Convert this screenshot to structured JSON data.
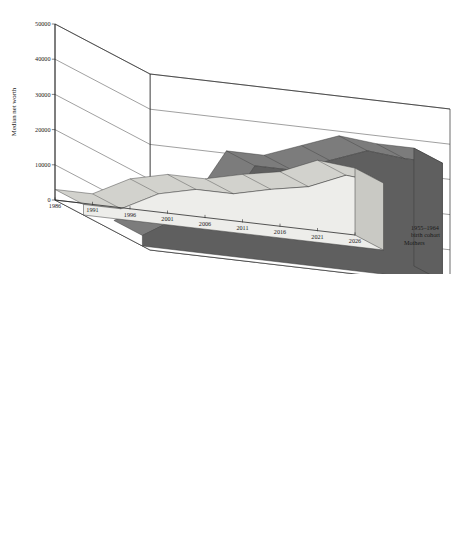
{
  "figure": {
    "background": "#ffffff",
    "panel_count": 2
  },
  "palette": {
    "series_back_top": "#7c7c7c",
    "series_back_side": "#5f5f5f",
    "series_back_edge": "#3a3a3a",
    "series_front_top": "#d2d2cd",
    "series_front_side": "#ededea",
    "series_front_edge": "#3a3a3a",
    "axis": "#2b2b2b",
    "floor": "#ffffff"
  },
  "charts": [
    {
      "id": "top-panel",
      "chart_data": {
        "type": "area",
        "title": "",
        "xlabel": "",
        "ylabel": "Median net worth",
        "ylim": [
          0,
          50000
        ],
        "yticks": [
          0,
          10000,
          20000,
          30000,
          40000,
          50000
        ],
        "ytick_labels": [
          "0",
          "10000",
          "20000",
          "30000",
          "40000",
          "50000"
        ],
        "categories": [
          1986,
          1991,
          1996,
          2001,
          2006,
          2011,
          2016,
          2021,
          2026
        ],
        "xtick_labels": [
          "1986",
          "1991",
          "1996",
          "2001",
          "2006",
          "2011",
          "2016",
          "2021",
          "2026"
        ],
        "grid": true,
        "legend_position": "right",
        "series": [
          {
            "name": "Mothers",
            "depth_index": 0,
            "color": "#d2d2cd",
            "values": [
              3000,
              3000,
              8500,
              11000,
              11000,
              13500,
              15500,
              20000,
              19000
            ]
          },
          {
            "name": "1955–1964 birth cohort",
            "depth_index": 1,
            "color": "#7c7c7c",
            "values": [
              3000,
              9500,
              9500,
              26500,
              26500,
              30500,
              34500,
              33500,
              33500
            ]
          }
        ]
      },
      "legend": {
        "lines": [
          "1955–1964",
          "birth cohort",
          "Mothers"
        ],
        "cohort_label": "1955–1964 birth cohort",
        "mothers_label": "Mothers"
      }
    },
    {
      "id": "bottom-panel",
      "chart_data": {
        "type": "area",
        "title": "",
        "xlabel": "",
        "ylabel": "Median net worth",
        "ylim": [
          0,
          70000
        ],
        "yticks": [
          0,
          10000,
          20000,
          30000,
          40000,
          50000,
          60000,
          70000
        ],
        "ytick_labels": [
          "0",
          "10000",
          "20000",
          "30000",
          "40000",
          "50000",
          "60000",
          "70000"
        ],
        "categories": [
          1976,
          1981,
          1986,
          1991,
          1996,
          2001,
          2006,
          2011,
          2016
        ],
        "xtick_labels": [
          "1976",
          "1981",
          "1986",
          "1991",
          "1996",
          "2001",
          "2006",
          "2011",
          "2016"
        ],
        "grid": true,
        "legend_position": "right",
        "series": [
          {
            "name": "Mothers",
            "depth_index": 0,
            "color": "#d2d2cd",
            "values": [
              3500,
              4500,
              13500,
              26000,
              21500,
              22500,
              22500,
              30500,
              31000
            ]
          },
          {
            "name": "1945–1954 birth cohort",
            "depth_index": 1,
            "color": "#7c7c7c",
            "values": [
              3500,
              10500,
              30500,
              52500,
              47500,
              55000,
              56000,
              56000,
              56000
            ]
          }
        ]
      },
      "legend": {
        "lines": [
          "1945–1954",
          "birth cohort",
          "Mothers"
        ],
        "cohort_label": "1945–1954 birth cohort",
        "mothers_label": "Mothers"
      }
    }
  ]
}
